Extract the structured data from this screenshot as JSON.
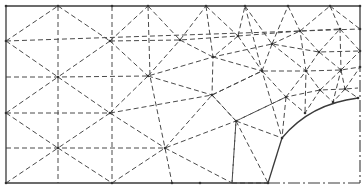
{
  "diagram": {
    "type": "finite-element-mesh",
    "colors": {
      "line": "#3a3a3a",
      "mesh": "#4a4a4a",
      "background": "#ffffff"
    },
    "boundary": {
      "solid": [
        [
          [
            6,
            183
          ],
          [
            6,
            6
          ]
        ],
        [
          [
            6,
            6
          ],
          [
            360,
            6
          ]
        ],
        [
          [
            360,
            6
          ],
          [
            360,
            60
          ]
        ],
        [
          [
            6,
            183
          ],
          [
            268,
            183
          ]
        ],
        [
          [
            268,
            183
          ],
          [
            282,
            138
          ]
        ]
      ],
      "arc": {
        "from": [
          282,
          138
        ],
        "to": [
          358,
          98
        ],
        "control": [
          310,
          104
        ]
      },
      "symmetry": [
        [
          [
            268,
            183
          ],
          [
            360,
            183
          ]
        ],
        [
          [
            360,
            60
          ],
          [
            360,
            183
          ]
        ]
      ]
    },
    "nodes": [
      [
        6,
        6
      ],
      [
        58,
        6
      ],
      [
        112,
        6
      ],
      [
        148,
        6
      ],
      [
        206,
        6
      ],
      [
        245,
        6
      ],
      [
        288,
        6
      ],
      [
        330,
        6
      ],
      [
        360,
        6
      ],
      [
        6,
        41
      ],
      [
        110,
        41
      ],
      [
        180,
        40
      ],
      [
        238,
        36
      ],
      [
        300,
        31
      ],
      [
        340,
        29
      ],
      [
        360,
        29
      ],
      [
        58,
        77
      ],
      [
        148,
        76
      ],
      [
        213,
        57
      ],
      [
        272,
        44
      ],
      [
        319,
        52
      ],
      [
        360,
        51
      ],
      [
        6,
        113
      ],
      [
        110,
        113
      ],
      [
        212,
        95
      ],
      [
        262,
        71
      ],
      [
        306,
        71
      ],
      [
        341,
        70
      ],
      [
        360,
        67
      ],
      [
        58,
        148
      ],
      [
        165,
        148
      ],
      [
        236,
        121
      ],
      [
        286,
        97
      ],
      [
        320,
        90
      ],
      [
        345,
        89
      ],
      [
        6,
        183
      ],
      [
        112,
        183
      ],
      [
        172,
        183
      ],
      [
        200,
        183
      ],
      [
        268,
        183
      ],
      [
        282,
        138
      ],
      [
        305,
        113
      ],
      [
        333,
        102
      ],
      [
        358,
        98
      ]
    ],
    "edges": [
      [
        [
          6,
          41
        ],
        [
          360,
          29
        ]
      ],
      [
        [
          6,
          77
        ],
        [
          58,
          77
        ],
        [
          148,
          76
        ],
        [
          213,
          57
        ],
        [
          272,
          44
        ],
        [
          319,
          52
        ],
        [
          360,
          51
        ]
      ],
      [
        [
          6,
          113
        ],
        [
          110,
          113
        ],
        [
          212,
          95
        ],
        [
          262,
          71
        ],
        [
          306,
          71
        ],
        [
          341,
          70
        ],
        [
          360,
          67
        ]
      ],
      [
        [
          6,
          148
        ],
        [
          58,
          148
        ],
        [
          165,
          148
        ],
        [
          236,
          121
        ],
        [
          286,
          97
        ],
        [
          320,
          90
        ],
        [
          345,
          89
        ],
        [
          358,
          88
        ]
      ],
      [
        [
          180,
          40
        ],
        [
          213,
          57
        ]
      ],
      [
        [
          110,
          41
        ],
        [
          180,
          40
        ],
        [
          238,
          36
        ],
        [
          300,
          31
        ],
        [
          340,
          29
        ]
      ],
      [
        [
          58,
          6
        ],
        [
          58,
          183
        ]
      ],
      [
        [
          112,
          6
        ],
        [
          112,
          183
        ]
      ],
      [
        [
          148,
          6
        ],
        [
          150,
          76
        ],
        [
          165,
          148
        ],
        [
          172,
          183
        ]
      ],
      [
        [
          206,
          6
        ],
        [
          213,
          57
        ],
        [
          212,
          95
        ],
        [
          236,
          121
        ],
        [
          232,
          183
        ]
      ],
      [
        [
          245,
          6
        ],
        [
          262,
          71
        ],
        [
          282,
          138
        ]
      ],
      [
        [
          288,
          6
        ],
        [
          300,
          31
        ],
        [
          306,
          71
        ],
        [
          305,
          113
        ]
      ],
      [
        [
          330,
          6
        ],
        [
          340,
          29
        ],
        [
          341,
          70
        ],
        [
          333,
          102
        ]
      ],
      [
        [
          6,
          41
        ],
        [
          58,
          6
        ]
      ],
      [
        [
          58,
          6
        ],
        [
          110,
          41
        ]
      ],
      [
        [
          6,
          41
        ],
        [
          58,
          77
        ]
      ],
      [
        [
          110,
          41
        ],
        [
          58,
          77
        ]
      ],
      [
        [
          6,
          113
        ],
        [
          58,
          77
        ]
      ],
      [
        [
          58,
          77
        ],
        [
          110,
          113
        ]
      ],
      [
        [
          6,
          113
        ],
        [
          58,
          148
        ]
      ],
      [
        [
          110,
          113
        ],
        [
          58,
          148
        ]
      ],
      [
        [
          6,
          183
        ],
        [
          58,
          148
        ]
      ],
      [
        [
          58,
          148
        ],
        [
          112,
          183
        ]
      ],
      [
        [
          110,
          41
        ],
        [
          148,
          6
        ]
      ],
      [
        [
          148,
          6
        ],
        [
          180,
          40
        ]
      ],
      [
        [
          110,
          41
        ],
        [
          148,
          76
        ]
      ],
      [
        [
          148,
          76
        ],
        [
          180,
          40
        ]
      ],
      [
        [
          110,
          113
        ],
        [
          148,
          76
        ]
      ],
      [
        [
          148,
          76
        ],
        [
          212,
          95
        ]
      ],
      [
        [
          110,
          113
        ],
        [
          165,
          148
        ]
      ],
      [
        [
          165,
          148
        ],
        [
          212,
          95
        ]
      ],
      [
        [
          112,
          183
        ],
        [
          165,
          148
        ]
      ],
      [
        [
          165,
          148
        ],
        [
          232,
          183
        ]
      ],
      [
        [
          180,
          40
        ],
        [
          206,
          6
        ]
      ],
      [
        [
          206,
          6
        ],
        [
          238,
          36
        ]
      ],
      [
        [
          238,
          36
        ],
        [
          213,
          57
        ]
      ],
      [
        [
          213,
          57
        ],
        [
          262,
          71
        ]
      ],
      [
        [
          238,
          36
        ],
        [
          262,
          71
        ]
      ],
      [
        [
          238,
          36
        ],
        [
          245,
          6
        ]
      ],
      [
        [
          245,
          6
        ],
        [
          272,
          44
        ]
      ],
      [
        [
          272,
          44
        ],
        [
          288,
          6
        ]
      ],
      [
        [
          272,
          44
        ],
        [
          300,
          31
        ]
      ],
      [
        [
          272,
          44
        ],
        [
          262,
          71
        ]
      ],
      [
        [
          272,
          44
        ],
        [
          306,
          71
        ]
      ],
      [
        [
          300,
          31
        ],
        [
          319,
          52
        ]
      ],
      [
        [
          319,
          52
        ],
        [
          340,
          29
        ]
      ],
      [
        [
          319,
          52
        ],
        [
          306,
          71
        ]
      ],
      [
        [
          319,
          52
        ],
        [
          341,
          70
        ]
      ],
      [
        [
          340,
          29
        ],
        [
          360,
          51
        ]
      ],
      [
        [
          341,
          70
        ],
        [
          360,
          51
        ]
      ],
      [
        [
          300,
          31
        ],
        [
          330,
          6
        ]
      ],
      [
        [
          330,
          6
        ],
        [
          360,
          29
        ]
      ],
      [
        [
          212,
          95
        ],
        [
          262,
          71
        ]
      ],
      [
        [
          262,
          71
        ],
        [
          286,
          97
        ]
      ],
      [
        [
          286,
          97
        ],
        [
          306,
          71
        ]
      ],
      [
        [
          306,
          71
        ],
        [
          320,
          90
        ]
      ],
      [
        [
          320,
          90
        ],
        [
          341,
          70
        ]
      ],
      [
        [
          341,
          70
        ],
        [
          345,
          89
        ]
      ],
      [
        [
          345,
          89
        ],
        [
          360,
          67
        ]
      ],
      [
        [
          212,
          95
        ],
        [
          236,
          121
        ]
      ],
      [
        [
          236,
          121
        ],
        [
          286,
          97
        ]
      ],
      [
        [
          236,
          121
        ],
        [
          282,
          138
        ]
      ],
      [
        [
          286,
          97
        ],
        [
          305,
          113
        ]
      ],
      [
        [
          286,
          97
        ],
        [
          282,
          138
        ]
      ],
      [
        [
          320,
          90
        ],
        [
          305,
          113
        ]
      ],
      [
        [
          320,
          90
        ],
        [
          333,
          102
        ]
      ],
      [
        [
          345,
          89
        ],
        [
          333,
          102
        ]
      ],
      [
        [
          345,
          89
        ],
        [
          358,
          98
        ]
      ],
      [
        [
          236,
          121
        ],
        [
          268,
          183
        ]
      ],
      [
        [
          236,
          121
        ],
        [
          232,
          183
        ]
      ],
      [
        [
          232,
          183
        ],
        [
          268,
          183
        ]
      ]
    ]
  }
}
